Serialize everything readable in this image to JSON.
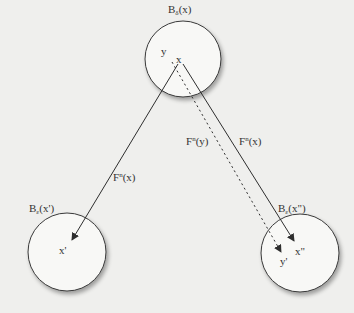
{
  "diagram": {
    "balls": [
      {
        "id": "top",
        "label_base": "B",
        "label_sub": "δ",
        "label_arg": "(x)",
        "cx": 183,
        "cy": 59,
        "r": 38
      },
      {
        "id": "left",
        "label_base": "B",
        "label_sub": "ε",
        "label_arg": "(x')",
        "cx": 67,
        "cy": 252,
        "r": 39
      },
      {
        "id": "right",
        "label_base": "B",
        "label_sub": "ε",
        "label_arg": "(x\")",
        "cx": 300,
        "cy": 253,
        "r": 39
      }
    ],
    "points": {
      "top_y": "y",
      "top_x": "x",
      "left_x_prime": "x'",
      "right_x_double_prime": "x\"",
      "right_y_prime": "y'"
    },
    "arrows": [
      {
        "id": "left-solid",
        "style": "solid",
        "label_base": "F",
        "label_sup": "n",
        "label_arg": "(x)"
      },
      {
        "id": "right-solid",
        "style": "solid",
        "label_base": "F",
        "label_sup": "n",
        "label_arg": "(x)"
      },
      {
        "id": "right-dotted",
        "style": "dotted",
        "label_base": "F",
        "label_sup": "n",
        "label_arg": "(y)"
      }
    ],
    "colors": {
      "background": "#efefed",
      "ball_fill": "#f8f8f6",
      "stroke": "#3a3a3a"
    }
  }
}
